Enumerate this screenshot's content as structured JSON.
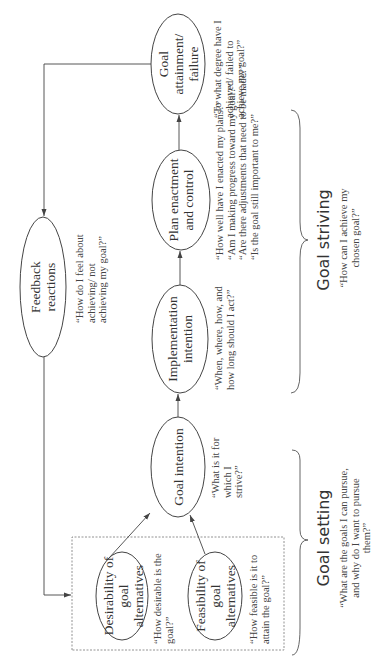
{
  "diagram": {
    "orientation": "rotated 90 degrees counter-clockwise",
    "nodes": {
      "desirability": {
        "label": "Desirability of goal alternatives",
        "question": "“How desirable is the goal?”"
      },
      "feasibility": {
        "label": "Feasibility of goal alternatives",
        "question": "“How feasible is it to attain the goal?”"
      },
      "goal_intention": {
        "label": "Goal intention",
        "question": "“What is it for which I strive?”"
      },
      "implementation_intention": {
        "label": "Implementation intention",
        "question": "“When, where, how, and how long should I act?”"
      },
      "plan_enactment": {
        "label": "Plan enactment and control",
        "questions": [
          "“How well have I enacted my plans?”",
          "“Am I making progress toward my goal?”",
          "“Are there adjustments that need to be made?”",
          "“Is the goal still important to me?”"
        ]
      },
      "goal_attainment": {
        "label": "Goal attainment/ failure",
        "question": "“To what degree have I achieved/ failed to achieve my goal?”"
      },
      "feedback": {
        "label": "Feedback reactions",
        "question": "“How do I feel about achieving/ not achieving my goal?”"
      }
    },
    "phases": {
      "goal_setting": {
        "label": "Goal setting",
        "question": "“What are the goals I can pursue, and why do I want to pursue them?”"
      },
      "goal_striving": {
        "label": "Goal striving",
        "question": "“How can I achieve my chosen goal?”"
      }
    },
    "edges": [
      {
        "from": "desirability",
        "to": "goal_intention"
      },
      {
        "from": "feasibility",
        "to": "goal_intention"
      },
      {
        "from": "goal_intention",
        "to": "implementation_intention"
      },
      {
        "from": "implementation_intention",
        "to": "plan_enactment"
      },
      {
        "from": "plan_enactment",
        "to": "goal_attainment"
      },
      {
        "from": "goal_attainment",
        "to": "feedback"
      },
      {
        "from": "feedback",
        "to": "goal_alternatives_box"
      }
    ],
    "colors": {
      "line": "#444444",
      "text": "#333333",
      "background": "#ffffff"
    }
  }
}
